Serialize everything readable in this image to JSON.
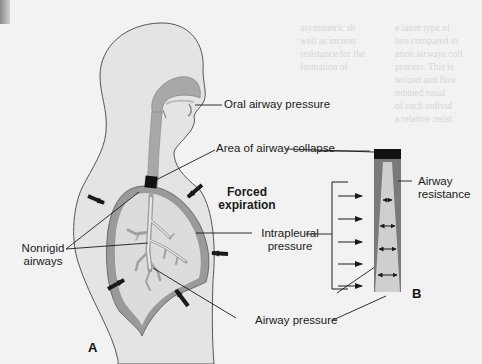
{
  "figure": {
    "panel_a_letter": "A",
    "panel_b_letter": "B",
    "labels": {
      "oral_airway_pressure": "Oral airway pressure",
      "area_of_airway_collapse": "Area of airway collapse",
      "forced_expiration_line1": "Forced",
      "forced_expiration_line2": "expiration",
      "nonrigid_airways_line1": "Nonrigid",
      "nonrigid_airways_line2": "airways",
      "intrapleural_pressure_line1": "Intrapleural",
      "intrapleural_pressure_line2": "pressure",
      "airway_pressure": "Airway pressure",
      "airway_resistance_line1": "Airway",
      "airway_resistance_line2": "resistance"
    },
    "colors": {
      "background": "#f2f2f2",
      "body_fill": "#e4e4e4",
      "body_outline": "#555555",
      "lung_fill": "#dcdcdc",
      "pleura_fill": "#9a9a9a",
      "airway_fill": "#a8a8a8",
      "collapse_block": "#111111",
      "tube_outer": "#7a7a7a",
      "tube_inner": "#cfcfcf",
      "arrow": "#1a1a1a"
    }
  },
  "bleed_text": {
    "top_right_block": "e latter type of\nhen compared to\nation airways coll\nprocess. This is\nterized and flow\nmbined nasal\nof each individ\na relative resist",
    "top_mid_block": "asymmetric sh\nwell as increas\nresistance for the\nformation of"
  }
}
